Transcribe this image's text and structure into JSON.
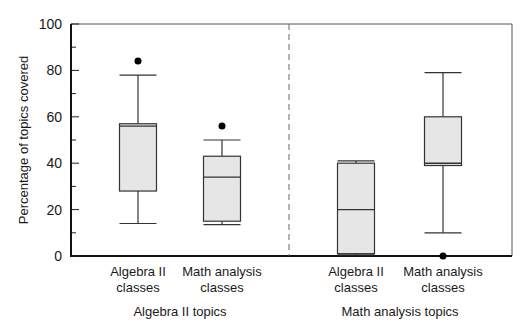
{
  "chart_data": {
    "type": "boxplot",
    "title": "",
    "ylabel": "Percentage of topics covered",
    "ylim": [
      0,
      100
    ],
    "yticks": [
      0,
      20,
      40,
      60,
      80,
      100
    ],
    "grid": false,
    "groups": [
      {
        "label": "Algebra II topics",
        "boxes": [
          {
            "label_line1": "Algebra II",
            "label_line2": "classes",
            "whisker_low": 14,
            "q1": 28,
            "median": 56,
            "q3": 57,
            "whisker_high": 78,
            "outliers": [
              84
            ]
          },
          {
            "label_line1": "Math analysis",
            "label_line2": "classes",
            "whisker_low": 13.5,
            "q1": 15,
            "median": 34,
            "q3": 43,
            "whisker_high": 50,
            "outliers": [
              56
            ]
          }
        ]
      },
      {
        "label": "Math analysis topics",
        "boxes": [
          {
            "label_line1": "Algebra II",
            "label_line2": "classes",
            "whisker_low": 0.5,
            "q1": 1,
            "median": 20,
            "q3": 40,
            "whisker_high": 41,
            "outliers": []
          },
          {
            "label_line1": "Math analysis",
            "label_line2": "classes",
            "whisker_low": 10,
            "q1": 39,
            "median": 40,
            "q3": 60,
            "whisker_high": 79,
            "outliers": [
              0
            ]
          }
        ]
      }
    ]
  },
  "colors": {
    "box_fill": "#e6e6e6",
    "line": "#333333"
  }
}
